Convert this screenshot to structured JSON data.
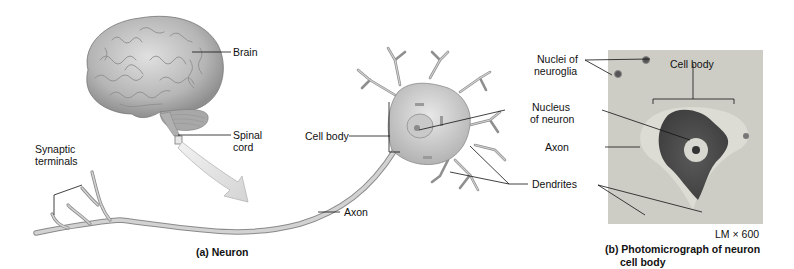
{
  "panel_a": {
    "caption": "(a) Neuron",
    "labels": {
      "brain": "Brain",
      "spinal_cord_line1": "Spinal",
      "spinal_cord_line2": "cord",
      "synaptic_line1": "Synaptic",
      "synaptic_line2": "terminals",
      "cell_body": "Cell body",
      "nucleus_line1": "Nucleus",
      "nucleus_line2": "of neuron",
      "axon": "Axon",
      "dendrites": "Dendrites"
    }
  },
  "panel_b": {
    "caption_line1": "(b) Photomicrograph of neuron",
    "caption_line2": "cell body",
    "magnification": "LM × 600",
    "labels": {
      "nuclei_line1": "Nuclei of",
      "nuclei_line2": "neuroglia",
      "cell_body": "Cell body",
      "axon": "Axon"
    }
  },
  "colors": {
    "brain": "#b9b9b9",
    "neuron": "#c4c4c4",
    "micrograph_bg": "#cfcfc8",
    "stain": "#4a4a4a",
    "leader_line": "#111111"
  }
}
